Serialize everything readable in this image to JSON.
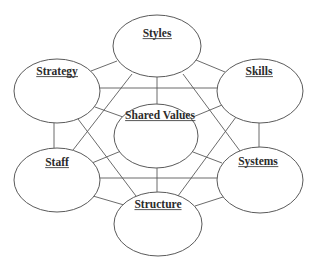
{
  "diagram": {
    "title": "",
    "colors": {
      "background": "#ffffff",
      "line": "#5a5a5a",
      "node_fill": "#ffffff",
      "text": "#2b2b2b"
    },
    "nodes": [
      {
        "id": "styles",
        "label": "Styles",
        "cx": 157,
        "cy": 46,
        "rx": 44,
        "ry": 31,
        "label_x": 157,
        "label_y": 37
      },
      {
        "id": "strategy",
        "label": "Strategy",
        "cx": 57,
        "cy": 91,
        "rx": 43,
        "ry": 32,
        "label_x": 57,
        "label_y": 75
      },
      {
        "id": "skills",
        "label": "Skills",
        "cx": 260,
        "cy": 91,
        "rx": 43,
        "ry": 32,
        "label_x": 259,
        "label_y": 75
      },
      {
        "id": "shared_values",
        "label": "Shared Values",
        "cx": 156,
        "cy": 136,
        "rx": 42,
        "ry": 32,
        "label_x": 160,
        "label_y": 119
      },
      {
        "id": "staff",
        "label": "Staff",
        "cx": 57,
        "cy": 180,
        "rx": 43,
        "ry": 32,
        "label_x": 57,
        "label_y": 166
      },
      {
        "id": "systems",
        "label": "Systems",
        "cx": 260,
        "cy": 180,
        "rx": 43,
        "ry": 33,
        "label_x": 258,
        "label_y": 165
      },
      {
        "id": "structure",
        "label": "Structure",
        "cx": 158,
        "cy": 224,
        "rx": 44,
        "ry": 32,
        "label_x": 158,
        "label_y": 208
      }
    ],
    "edges": [
      {
        "from": "strategy",
        "to": "styles",
        "x1": 91,
        "y1": 71,
        "x2": 117,
        "y2": 61
      },
      {
        "from": "styles",
        "to": "skills",
        "x1": 196,
        "y1": 60,
        "x2": 225,
        "y2": 72
      },
      {
        "from": "styles",
        "to": "shared_values",
        "x1": 157,
        "y1": 77,
        "x2": 157,
        "y2": 104
      },
      {
        "from": "styles",
        "to": "staff",
        "x1": 132,
        "y1": 74,
        "x2": 73,
        "y2": 150
      },
      {
        "from": "styles",
        "to": "systems",
        "x1": 183,
        "y1": 74,
        "x2": 240,
        "y2": 151
      },
      {
        "from": "strategy",
        "to": "skills",
        "x1": 99,
        "y1": 88,
        "x2": 218,
        "y2": 88
      },
      {
        "from": "strategy",
        "to": "shared_values",
        "x1": 95,
        "y1": 107,
        "x2": 123,
        "y2": 117
      },
      {
        "from": "strategy",
        "to": "staff",
        "x1": 54,
        "y1": 123,
        "x2": 54,
        "y2": 148
      },
      {
        "from": "strategy",
        "to": "structure",
        "x1": 78,
        "y1": 119,
        "x2": 136,
        "y2": 196
      },
      {
        "from": "skills",
        "to": "shared_values",
        "x1": 222,
        "y1": 105,
        "x2": 193,
        "y2": 117
      },
      {
        "from": "skills",
        "to": "systems",
        "x1": 259,
        "y1": 123,
        "x2": 259,
        "y2": 147
      },
      {
        "from": "skills",
        "to": "structure",
        "x1": 236,
        "y1": 117,
        "x2": 178,
        "y2": 196
      },
      {
        "from": "staff",
        "to": "shared_values",
        "x1": 92,
        "y1": 163,
        "x2": 121,
        "y2": 151
      },
      {
        "from": "staff",
        "to": "systems",
        "x1": 99,
        "y1": 178,
        "x2": 218,
        "y2": 178
      },
      {
        "from": "staff",
        "to": "structure",
        "x1": 93,
        "y1": 196,
        "x2": 124,
        "y2": 205
      },
      {
        "from": "systems",
        "to": "shared_values",
        "x1": 222,
        "y1": 163,
        "x2": 193,
        "y2": 152
      },
      {
        "from": "systems",
        "to": "structure",
        "x1": 223,
        "y1": 197,
        "x2": 195,
        "y2": 206
      },
      {
        "from": "shared_values",
        "to": "structure",
        "x1": 157,
        "y1": 168,
        "x2": 157,
        "y2": 192
      }
    ]
  }
}
